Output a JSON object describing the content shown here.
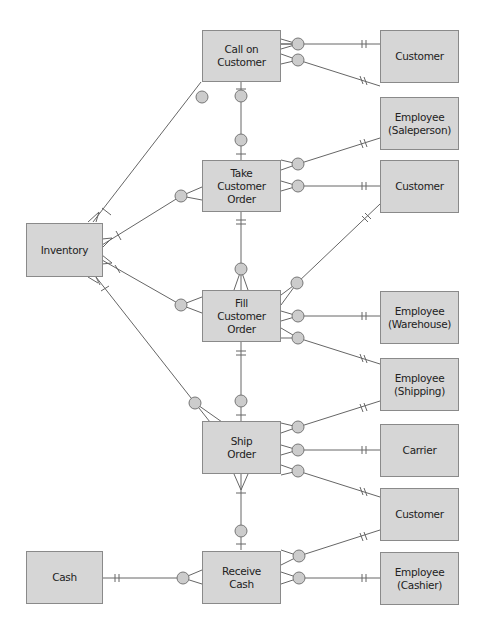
{
  "diagram": {
    "type": "REA entity-relationship diagram",
    "colors": {
      "box_fill": "#d6d6d6",
      "box_border": "#8a8a8a",
      "line": "#666666",
      "circle_fill": "#cccccc"
    },
    "events": [
      {
        "id": "call",
        "label": "Call on\nCustomer"
      },
      {
        "id": "take",
        "label": "Take\nCustomer\nOrder"
      },
      {
        "id": "fill",
        "label": "Fill\nCustomer\nOrder"
      },
      {
        "id": "ship",
        "label": "Ship\nOrder"
      },
      {
        "id": "receive",
        "label": "Receive\nCash"
      }
    ],
    "resources": [
      {
        "id": "inventory",
        "label": "Inventory"
      },
      {
        "id": "cash",
        "label": "Cash"
      }
    ],
    "agents": [
      {
        "id": "cust1",
        "label": "Customer"
      },
      {
        "id": "emp_sales",
        "label": "Employee\n(Saleperson)"
      },
      {
        "id": "cust2",
        "label": "Customer"
      },
      {
        "id": "emp_wh",
        "label": "Employee\n(Warehouse)"
      },
      {
        "id": "emp_ship",
        "label": "Employee\n(Shipping)"
      },
      {
        "id": "carrier",
        "label": "Carrier"
      },
      {
        "id": "cust3",
        "label": "Customer"
      },
      {
        "id": "emp_cash",
        "label": "Employee\n(Cashier)"
      }
    ]
  }
}
